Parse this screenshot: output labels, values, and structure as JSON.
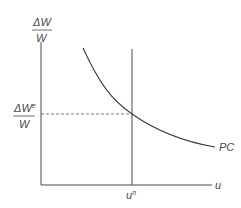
{
  "diagram": {
    "y_label_top": "ΔW",
    "y_label_bottom": "W",
    "expected_label_top": "ΔW",
    "expected_label_sup": "e",
    "expected_label_bottom": "W",
    "x_label": "u",
    "natural_rate_label": "u",
    "natural_rate_sup": "n",
    "curve_label": "PC",
    "colors": {
      "axis": "#4a4a4a",
      "curve": "#3a3a3a",
      "dashed": "#555555"
    }
  }
}
